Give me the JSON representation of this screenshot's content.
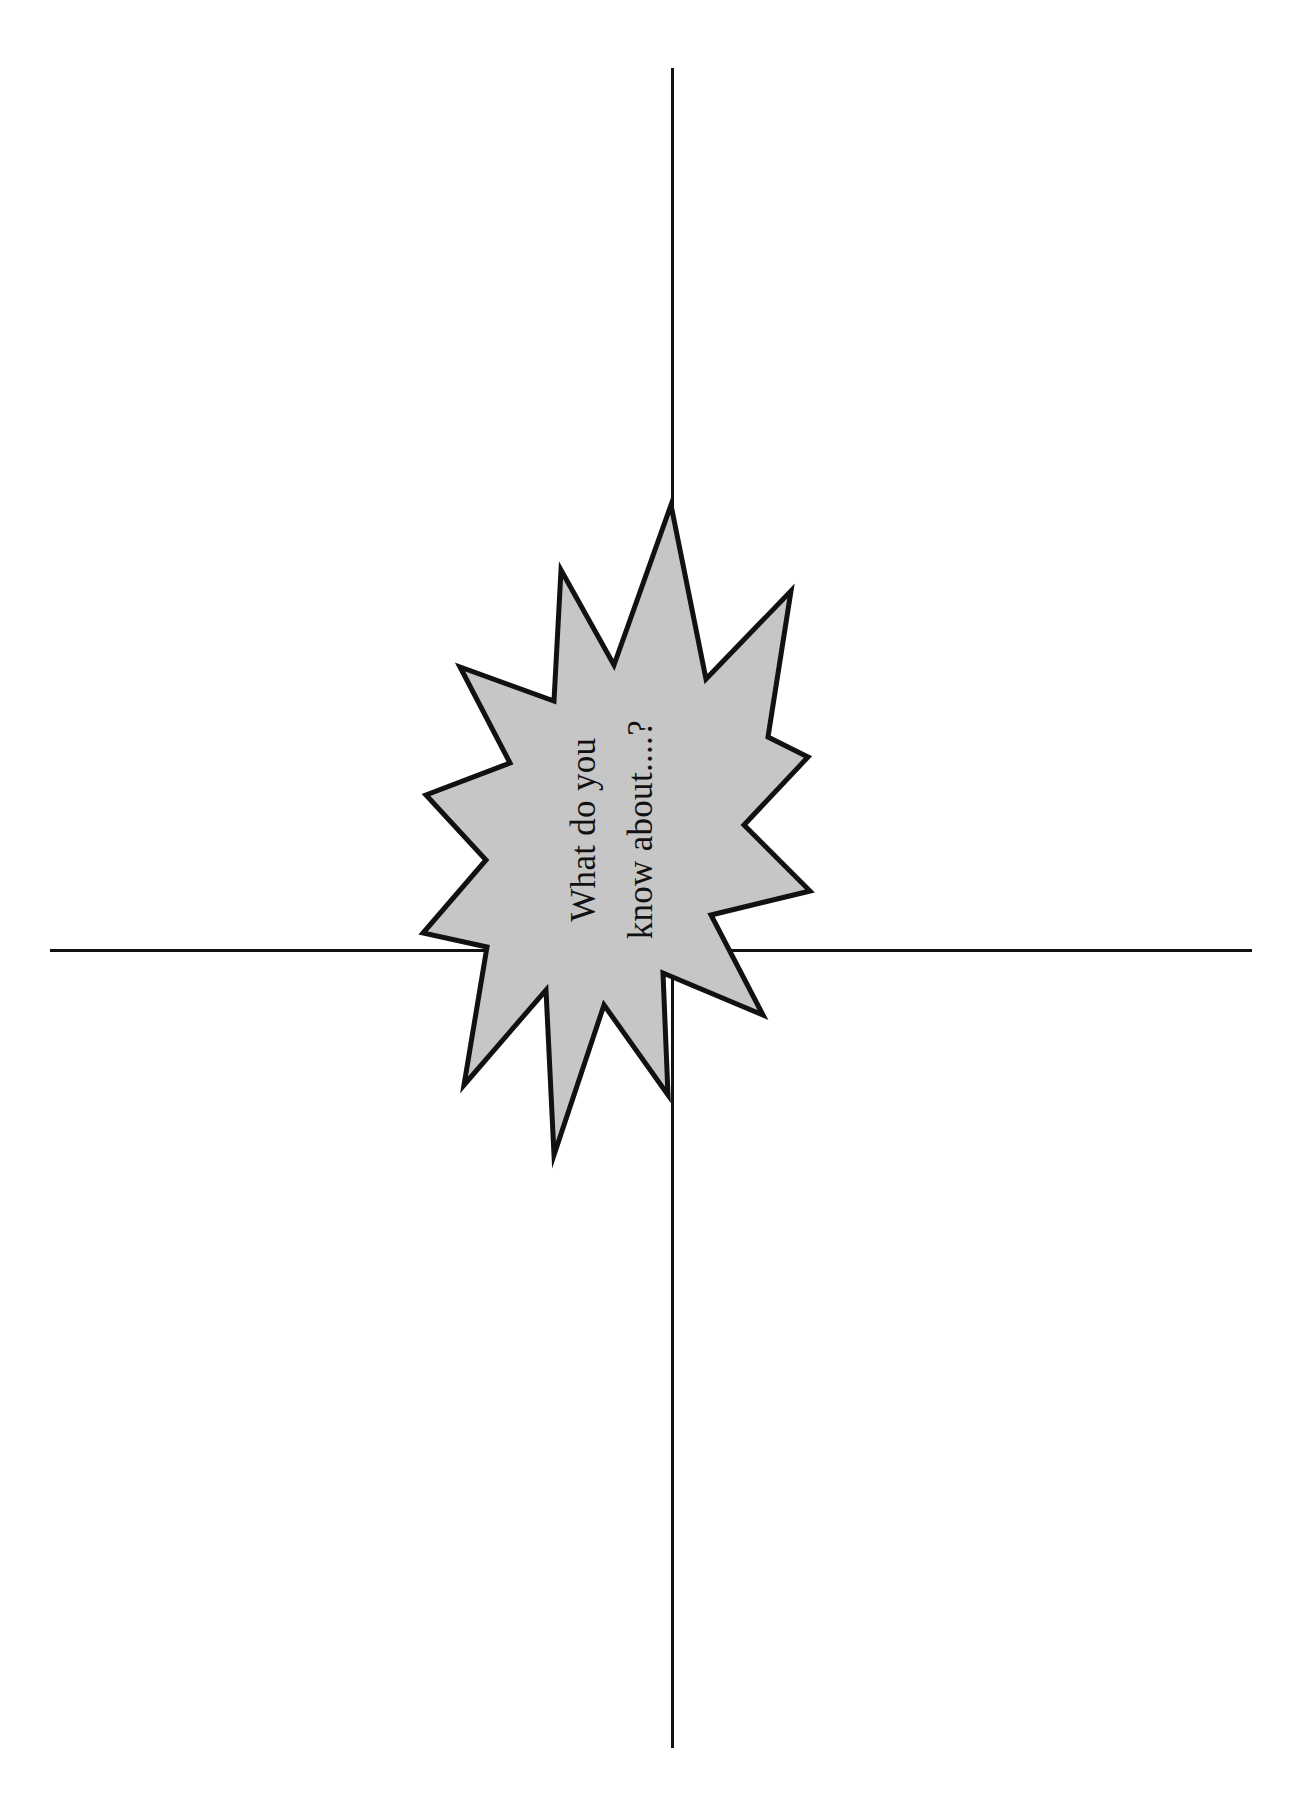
{
  "page": {
    "title": "What do you know about....?",
    "background_color": "#ffffff",
    "width": 1315,
    "height": 1808
  },
  "axes": {
    "line_color": "#111111",
    "vertical": {
      "name": "vertical-divider",
      "thickness_px": 3
    },
    "horizontal": {
      "name": "horizontal-divider",
      "thickness_px": 3
    }
  },
  "burst": {
    "shape": "10-point-starburst",
    "fill_color": "#c6c6c6",
    "stroke_color": "#111111",
    "stroke_width_px": 5,
    "caption_lines": [
      "What do you",
      "know about....?"
    ],
    "caption_rotation_deg": -90
  },
  "quadrants": [
    {
      "name": "quadrant-top-left",
      "label": ""
    },
    {
      "name": "quadrant-top-right",
      "label": ""
    },
    {
      "name": "quadrant-bottom-left",
      "label": ""
    },
    {
      "name": "quadrant-bottom-right",
      "label": ""
    }
  ]
}
